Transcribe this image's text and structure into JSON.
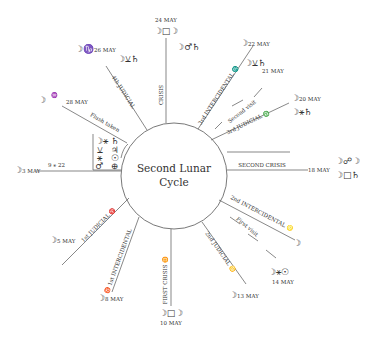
{
  "title": {
    "line1": "Second Lunar",
    "line2": "Cycle"
  },
  "spokes": [
    {
      "label": "CRISIS",
      "date": "24 MAY",
      "aspect": "☽□☽",
      "extra": "☽♂♄"
    },
    {
      "label": "3rd INTERCIDENTAL ♏",
      "date": "22 MAY",
      "aspect": "☽⚺♄"
    },
    {
      "label": "Second visit",
      "date": "21 MAY"
    },
    {
      "label": "3rd JUDICIAL ♎",
      "date": "20 MAY",
      "aspect": "☽⚹♄"
    },
    {
      "label": "SECOND CRISIS",
      "date": "18 MAY",
      "aspect": "☽☍☽",
      "extra": "☽□♄"
    },
    {
      "label": "2nd INTERCIDENTAL ♌",
      "moon": "☽"
    },
    {
      "label": "First visit",
      "date": "14 MAY",
      "aspect": "☽⚹☉"
    },
    {
      "label": "2nd JUDICIAL ♋",
      "date": "13 MAY"
    },
    {
      "label": "FIRST CRISIS ♊",
      "date": "10 MAY",
      "aspect": "☽□☽"
    },
    {
      "label": "♉ 1st INTERCIDENTAL",
      "date": "8 MAY"
    },
    {
      "label": "1st JUDICIAL ♈",
      "date": "5 MAY"
    },
    {
      "label": "3 MAY",
      "extra": "9 ⚹ 22"
    },
    {
      "label": "Flush taken",
      "date": "28 MAY",
      "sign": "♒"
    },
    {
      "label": "4th JUDICIAL",
      "date": "26 MAY",
      "sign": "♑",
      "aspect": "☽⚺♄"
    }
  ],
  "box": {
    "rows": [
      [
        "☽⚹",
        "♄"
      ],
      [
        "⚺",
        "♃"
      ],
      [
        "⚹",
        "☉"
      ],
      [
        "♂",
        "⊕"
      ]
    ]
  }
}
